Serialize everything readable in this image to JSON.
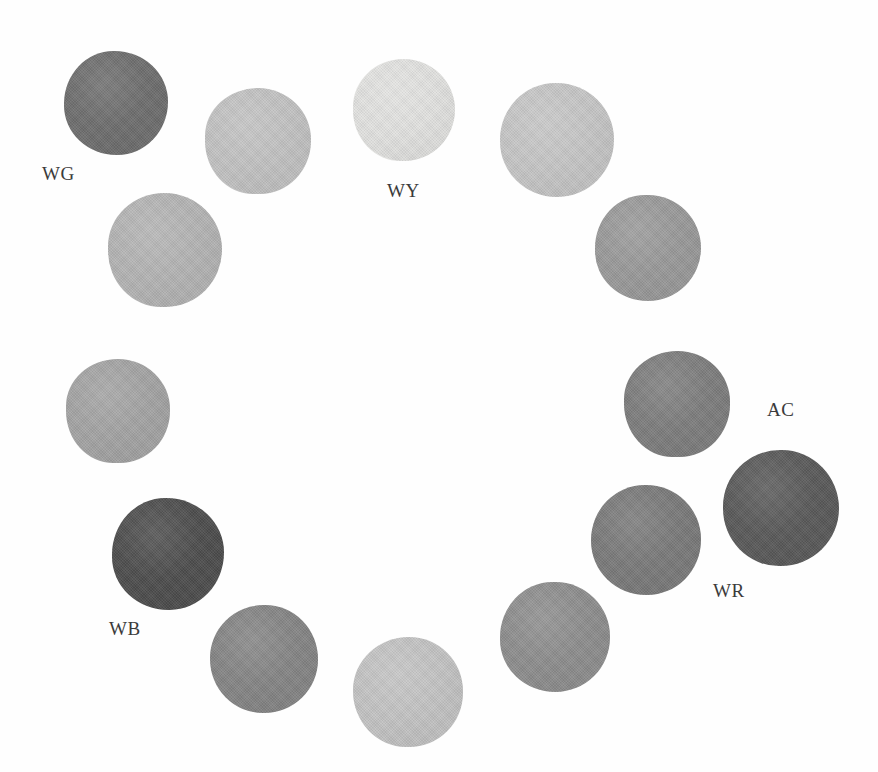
{
  "figure": {
    "width": 878,
    "height": 772,
    "background_color": "#fefefe"
  },
  "chart_data": {
    "type": "scatter",
    "title": "",
    "subtitle": "",
    "xlabel": "",
    "ylabel": "",
    "xlim": [
      0,
      878
    ],
    "ylim": [
      0,
      772
    ],
    "grid": false,
    "legend_position": "none",
    "annotations": [
      "WG",
      "WY",
      "AC",
      "WR",
      "WB"
    ],
    "series": [
      {
        "name": "pigment swatches",
        "marker": "filled-circle",
        "points": [
          {
            "id": "s1",
            "label": "WG",
            "cx": 116,
            "cy": 103,
            "r": 52,
            "color": "#6f6f6f",
            "ring_index": 0
          },
          {
            "id": "s2",
            "label": "",
            "cx": 258,
            "cy": 141,
            "r": 53,
            "color": "#c2c2c2",
            "ring_index": 1
          },
          {
            "id": "s3",
            "label": "WY",
            "cx": 404,
            "cy": 110,
            "r": 51,
            "color": "#e2e2e0",
            "ring_index": 2
          },
          {
            "id": "s4",
            "label": "",
            "cx": 557,
            "cy": 140,
            "r": 57,
            "color": "#c6c6c6",
            "ring_index": 3
          },
          {
            "id": "s5",
            "label": "",
            "cx": 648,
            "cy": 248,
            "r": 53,
            "color": "#9a9a9a",
            "ring_index": 4
          },
          {
            "id": "s6",
            "label": "AC",
            "cx": 677,
            "cy": 404,
            "r": 53,
            "color": "#7e7e7e",
            "ring_index": 5
          },
          {
            "id": "s7",
            "label": "",
            "cx": 781,
            "cy": 508,
            "r": 58,
            "color": "#5a5a5a",
            "ring_index": 6
          },
          {
            "id": "s8",
            "label": "WR",
            "cx": 646,
            "cy": 540,
            "r": 55,
            "color": "#7b7b7b",
            "ring_index": 7
          },
          {
            "id": "s9",
            "label": "",
            "cx": 555,
            "cy": 637,
            "r": 55,
            "color": "#8e8e8e",
            "ring_index": 8
          },
          {
            "id": "s10",
            "label": "",
            "cx": 408,
            "cy": 692,
            "r": 55,
            "color": "#c3c3c3",
            "ring_index": 9
          },
          {
            "id": "s11",
            "label": "",
            "cx": 264,
            "cy": 659,
            "r": 54,
            "color": "#858585",
            "ring_index": 10
          },
          {
            "id": "s12",
            "label": "WB",
            "cx": 168,
            "cy": 554,
            "r": 56,
            "color": "#4e4e4e",
            "ring_index": 11
          },
          {
            "id": "s13",
            "label": "",
            "cx": 118,
            "cy": 411,
            "r": 52,
            "color": "#a4a4a4",
            "ring_index": 12
          },
          {
            "id": "s14",
            "label": "",
            "cx": 165,
            "cy": 250,
            "r": 57,
            "color": "#b4b4b4",
            "ring_index": 13
          }
        ]
      }
    ],
    "labels": [
      {
        "text": "WG",
        "x": 42,
        "y": 164
      },
      {
        "text": "WY",
        "x": 387,
        "y": 181
      },
      {
        "text": "AC",
        "x": 767,
        "y": 400
      },
      {
        "text": "WR",
        "x": 713,
        "y": 581
      },
      {
        "text": "WB",
        "x": 109,
        "y": 619
      }
    ]
  }
}
